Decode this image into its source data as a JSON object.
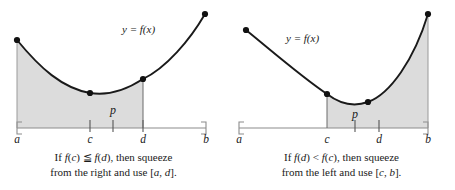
{
  "figure": {
    "type": "math-diagram",
    "shade_color": "#dcdcdc",
    "curve_color": "#1a1a1a",
    "axis_color": "#8c8c8c",
    "dot_color": "#111111"
  },
  "panels": [
    {
      "id": "left",
      "curve_label": "y = f(x)",
      "interior_label": "p",
      "axis_labels": [
        "a",
        "c",
        "d",
        "b"
      ],
      "shaded_interval": "[a, d]",
      "caption_line1": "If f(c) ≦ f(d), then squeeze",
      "caption_line2": "from the right and use [a, d]."
    },
    {
      "id": "right",
      "curve_label": "y = f(x)",
      "interior_label": "p",
      "axis_labels": [
        "a",
        "c",
        "d",
        "b"
      ],
      "shaded_interval": "[c, b]",
      "caption_line1": "If f(d) < f(c), then squeeze",
      "caption_line2": "from the left and use [c, b]."
    }
  ],
  "chart_data": {
    "type": "line",
    "title": "",
    "xlabel": "",
    "ylabel": "",
    "grid": false,
    "legend": "none",
    "panels": [
      {
        "name": "left-panel",
        "xlim": [
          0,
          1
        ],
        "ylim": [
          0,
          1
        ],
        "axis_ticks": [
          {
            "label": "a",
            "x": 0.0
          },
          {
            "label": "c",
            "x": 0.4
          },
          {
            "label": "p",
            "x": 0.52
          },
          {
            "label": "d",
            "x": 0.66
          }
        ],
        "endpoint_brackets": [
          "a",
          "b"
        ],
        "marked_points": [
          {
            "label": "a",
            "x": 0.0,
            "y": 0.78
          },
          {
            "label": "c",
            "x": 0.4,
            "y": 0.18
          },
          {
            "label": "d",
            "x": 0.66,
            "y": 0.29
          },
          {
            "label": "b",
            "x": 1.0,
            "y": 0.97
          }
        ],
        "shaded_from": "a",
        "shaded_to": "d"
      },
      {
        "name": "right-panel",
        "xlim": [
          0,
          1
        ],
        "ylim": [
          0,
          1
        ],
        "axis_ticks": [
          {
            "label": "a",
            "x": 0.0
          },
          {
            "label": "c",
            "x": 0.44
          },
          {
            "label": "p",
            "x": 0.58
          },
          {
            "label": "d",
            "x": 0.7
          }
        ],
        "endpoint_brackets": [
          "a",
          "b"
        ],
        "marked_points": [
          {
            "label": "a",
            "x": 0.04,
            "y": 0.7
          },
          {
            "label": "c",
            "x": 0.44,
            "y": 0.21
          },
          {
            "label": "d",
            "x": 0.7,
            "y": 0.22
          },
          {
            "label": "b",
            "x": 1.0,
            "y": 0.98
          }
        ],
        "shaded_from": "c",
        "shaded_to": "b"
      }
    ]
  }
}
